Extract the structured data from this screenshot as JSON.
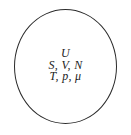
{
  "figure": {
    "kind": "thermodynamic-system-diagram",
    "boundary": {
      "shape": "circle",
      "stroke_color": "#2b2b2b",
      "fill_color": "#ffffff",
      "stroke_width_px": 1
    },
    "background_color": "#ffffff",
    "text_color": "#1c1c1c",
    "variable_lines": [
      {
        "text": "U"
      },
      {
        "text": "S, V, N"
      },
      {
        "text": "T, p, μ"
      }
    ]
  }
}
